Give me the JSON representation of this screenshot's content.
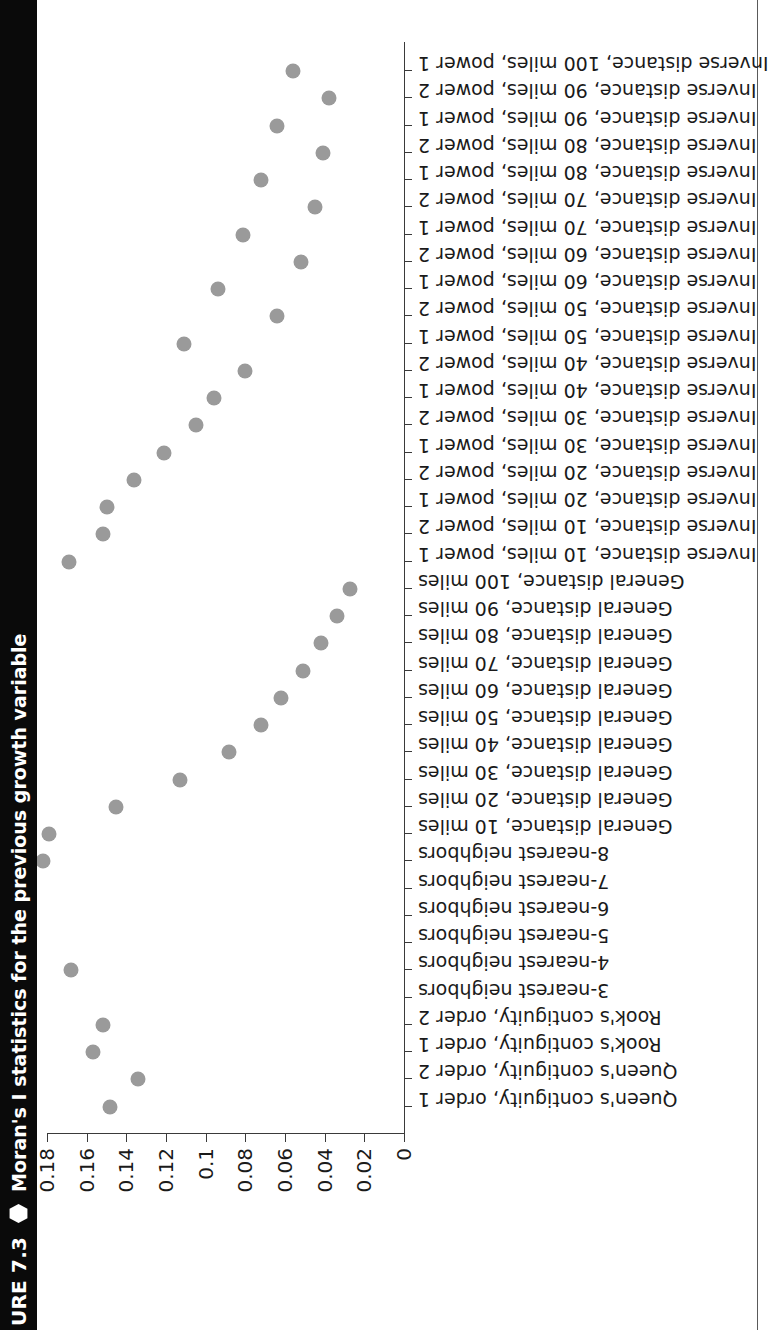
{
  "figure": {
    "number": "URE 7.3",
    "bullet_icon": "hexagon-icon",
    "title": "Moran's I statistics for the previous growth variable"
  },
  "chart_data": {
    "type": "scatter",
    "title": "Moran's I statistics for the previous growth variable",
    "xlabel": "",
    "ylabel": "",
    "orientation": "vertical-category-axis",
    "grid": false,
    "legend": null,
    "ylim": [
      0,
      0.18
    ],
    "yticks": [
      "0",
      "0.02",
      "0.04",
      "0.06",
      "0.08",
      "0.1",
      "0.12",
      "0.14",
      "0.16",
      "0.18"
    ],
    "ytick_values": [
      0,
      0.02,
      0.04,
      0.06,
      0.08,
      0.1,
      0.12,
      0.14,
      0.16,
      0.18
    ],
    "categories": [
      "Queen's contiguity, order 1",
      "Queen's contiguity, order 2",
      "Rook's contiguity, order 1",
      "Rook's contiguity, order 2",
      "3-nearest neighbors",
      "4-nearest neighbors",
      "5-nearest neighbors",
      "6-nearest neighbors",
      "7-nearest neighbors",
      "8-nearest neighbors",
      "General distance, 10 miles",
      "General distance, 20 miles",
      "General distance, 30 miles",
      "General distance, 40 miles",
      "General distance, 50 miles",
      "General distance, 60 miles",
      "General distance, 70 miles",
      "General distance, 80 miles",
      "General distance, 90 miles",
      "General distance, 100 miles",
      "Inverse distance, 10 miles, power 1",
      "Inverse distance, 10 miles, power 2",
      "Inverse distance, 20 miles, power 1",
      "Inverse distance, 20 miles, power 2",
      "Inverse distance, 30 miles, power 1",
      "Inverse distance, 30 miles, power 2",
      "Inverse distance, 40 miles, power 1",
      "Inverse distance, 40 miles, power 2",
      "Inverse distance, 50 miles, power 1",
      "Inverse distance, 50 miles, power 2",
      "Inverse distance, 60 miles, power 1",
      "Inverse distance, 60 miles, power 2",
      "Inverse distance, 70 miles, power 1",
      "Inverse distance, 70 miles, power 2",
      "Inverse distance, 80 miles, power 1",
      "Inverse distance, 80 miles, power 2",
      "Inverse distance, 90 miles, power 1",
      "Inverse distance, 90 miles, power 2",
      "Inverse distance, 100 miles, power 1"
    ],
    "values": [
      0.148,
      0.134,
      0.157,
      0.152,
      null,
      0.168,
      null,
      null,
      null,
      0.182,
      0.179,
      0.145,
      0.113,
      0.088,
      0.072,
      0.062,
      0.051,
      0.042,
      0.034,
      0.027,
      0.169,
      0.152,
      0.15,
      0.136,
      0.121,
      0.105,
      0.096,
      0.08,
      0.111,
      0.064,
      0.094,
      0.052,
      0.081,
      0.045,
      0.072,
      0.041,
      0.064,
      0.038,
      0.056
    ]
  }
}
